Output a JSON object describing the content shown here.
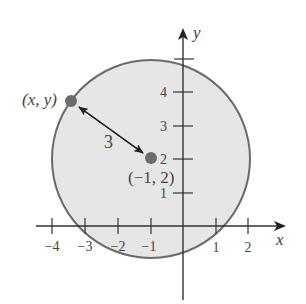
{
  "diagram": {
    "type": "circle-on-coordinate-plane",
    "colors": {
      "circle_fill": "#e6e6e6",
      "circle_stroke": "#6a6a6a",
      "axis": "#333333",
      "point": "#6b6b6b",
      "text": "#444444"
    },
    "axes": {
      "x_label": "x",
      "y_label": "y",
      "x_ticks": [
        {
          "value": -4,
          "label": "−4"
        },
        {
          "value": -3,
          "label": "−3"
        },
        {
          "value": -2,
          "label": "−2"
        },
        {
          "value": -1,
          "label": "−1"
        },
        {
          "value": 1,
          "label": "1"
        },
        {
          "value": 2,
          "label": "2"
        }
      ],
      "y_ticks": [
        {
          "value": 1,
          "label": "1"
        },
        {
          "value": 2,
          "label": "2"
        },
        {
          "value": 3,
          "label": "3"
        },
        {
          "value": 4,
          "label": "4"
        },
        {
          "value": 5,
          "label": ""
        }
      ]
    },
    "circle": {
      "center": [
        -1,
        2
      ],
      "radius": 3
    },
    "center_label": "(−1, 2)",
    "point_label": "(x, y)",
    "radius_label": "3"
  }
}
